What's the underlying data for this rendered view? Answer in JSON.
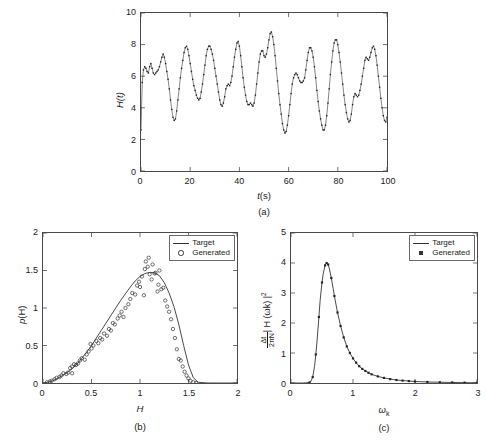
{
  "figure": {
    "panels": [
      "a",
      "b",
      "c"
    ],
    "background_color": "#ffffff",
    "line_color": "#333333",
    "axis_color": "#4a4a4a"
  },
  "panel_a": {
    "caption": "(a)",
    "xlabel_var": "t",
    "xlabel_unit": "(s)",
    "ylabel_var": "H",
    "ylabel_arg": "(t)",
    "xticks": [
      "0",
      "20",
      "40",
      "60",
      "80",
      "100"
    ],
    "yticks": [
      "0",
      "2",
      "4",
      "6",
      "8",
      "10"
    ]
  },
  "panel_b": {
    "caption": "(b)",
    "xlabel": "H",
    "ylabel_var": "p",
    "ylabel_arg": "(H)",
    "xticks": [
      "0",
      "0.5",
      "1",
      "1.5",
      "2"
    ],
    "yticks": [
      "0",
      "0.5",
      "1",
      "1.5",
      "2"
    ],
    "legend": [
      {
        "label": "Target",
        "marker": "line"
      },
      {
        "label": "Generated",
        "marker": "circle"
      }
    ]
  },
  "panel_c": {
    "caption": "(c)",
    "xlabel_var": "ω",
    "xlabel_sub": "k",
    "ylabel_num": "Δt",
    "ylabel_den": "2πN",
    "ylabel_rest": "| H (ωk) |",
    "ylabel_exp": "2",
    "xticks": [
      "0",
      "1",
      "2",
      "3"
    ],
    "yticks": [
      "0",
      "1",
      "2",
      "3",
      "4",
      "5"
    ],
    "legend": [
      {
        "label": "Target",
        "marker": "line"
      },
      {
        "label": "Generated",
        "marker": "square"
      }
    ]
  },
  "chart_data": [
    {
      "type": "line",
      "panel": "a",
      "title": "",
      "xlabel": "t(s)",
      "ylabel": "H(t)",
      "xlim": [
        0,
        100
      ],
      "ylim": [
        0,
        10
      ],
      "xticks": [
        0,
        20,
        40,
        60,
        80,
        100
      ],
      "yticks": [
        0,
        2,
        4,
        6,
        8,
        10
      ],
      "grid": false,
      "legend": null,
      "marker": "dot",
      "series": [
        {
          "name": "H(t)",
          "x": [
            0,
            0.5,
            1,
            1.5,
            2,
            2.5,
            3,
            3.5,
            4,
            4.5,
            5,
            5.5,
            6,
            6.5,
            7,
            7.5,
            8,
            8.5,
            9,
            9.5,
            10,
            10.5,
            11,
            11.5,
            12,
            12.5,
            13,
            13.5,
            14,
            14.5,
            15,
            15.5,
            16,
            16.5,
            17,
            17.5,
            18,
            18.5,
            19,
            19.5,
            20,
            20.5,
            21,
            21.5,
            22,
            22.5,
            23,
            23.5,
            24,
            24.5,
            25,
            25.5,
            26,
            26.5,
            27,
            27.5,
            28,
            28.5,
            29,
            29.5,
            30,
            30.5,
            31,
            31.5,
            32,
            32.5,
            33,
            33.5,
            34,
            34.5,
            35,
            35.5,
            36,
            36.5,
            37,
            37.5,
            38,
            38.5,
            39,
            39.5,
            40,
            40.5,
            41,
            41.5,
            42,
            42.5,
            43,
            43.5,
            44,
            44.5,
            45,
            45.5,
            46,
            46.5,
            47,
            47.5,
            48,
            48.5,
            49,
            49.5,
            50,
            50.5,
            51,
            51.5,
            52,
            52.5,
            53,
            53.5,
            54,
            54.5,
            55,
            55.5,
            56,
            56.5,
            57,
            57.5,
            58,
            58.5,
            59,
            59.5,
            60,
            60.5,
            61,
            61.5,
            62,
            62.5,
            63,
            63.5,
            64,
            64.5,
            65,
            65.5,
            66,
            66.5,
            67,
            67.5,
            68,
            68.5,
            69,
            69.5,
            70,
            70.5,
            71,
            71.5,
            72,
            72.5,
            73,
            73.5,
            74,
            74.5,
            75,
            75.5,
            76,
            76.5,
            77,
            77.5,
            78,
            78.5,
            79,
            79.5,
            80,
            80.5,
            81,
            81.5,
            82,
            82.5,
            83,
            83.5,
            84,
            84.5,
            85,
            85.5,
            86,
            86.5,
            87,
            87.5,
            88,
            88.5,
            89,
            89.5,
            90,
            90.5,
            91,
            91.5,
            92,
            92.5,
            93,
            93.5,
            94,
            94.5,
            95,
            95.5,
            96,
            96.5,
            97,
            97.5,
            98,
            98.5,
            99,
            99.5,
            100
          ],
          "y": [
            2.6,
            5.6,
            6.4,
            6.6,
            6.5,
            6.3,
            6.2,
            6.6,
            6.8,
            6.5,
            6.2,
            6.1,
            6.2,
            6.3,
            6.4,
            6.6,
            6.9,
            7.2,
            7.4,
            7.2,
            6.8,
            6.3,
            5.8,
            5.2,
            4.5,
            3.9,
            3.4,
            3.2,
            3.3,
            3.8,
            4.5,
            5.2,
            5.9,
            6.5,
            7.0,
            7.5,
            7.8,
            7.9,
            7.7,
            7.3,
            6.8,
            6.3,
            5.8,
            5.4,
            5.1,
            4.8,
            4.6,
            4.5,
            4.6,
            5.0,
            5.5,
            6.1,
            6.7,
            7.3,
            7.7,
            7.9,
            7.9,
            7.7,
            7.4,
            7.0,
            6.5,
            6.0,
            5.5,
            5.0,
            4.5,
            4.2,
            4.1,
            4.3,
            4.7,
            5.2,
            5.4,
            5.5,
            5.4,
            5.6,
            6.0,
            6.6,
            7.2,
            7.7,
            8.1,
            8.2,
            7.9,
            7.3,
            6.6,
            5.9,
            5.3,
            4.8,
            4.4,
            4.2,
            4.2,
            4.3,
            4.2,
            4.1,
            4.3,
            4.8,
            5.5,
            6.2,
            6.9,
            7.4,
            7.6,
            7.6,
            7.3,
            7.2,
            7.4,
            7.8,
            8.3,
            8.7,
            8.8,
            8.5,
            8.0,
            7.3,
            6.5,
            5.7,
            4.9,
            4.2,
            3.6,
            3.0,
            2.6,
            2.4,
            2.5,
            2.9,
            3.5,
            4.2,
            4.9,
            5.5,
            5.9,
            6.1,
            6.2,
            6.1,
            5.9,
            5.7,
            5.6,
            5.6,
            5.7,
            5.9,
            6.4,
            7.0,
            7.5,
            7.8,
            7.8,
            7.6,
            7.2,
            6.6,
            5.9,
            5.1,
            4.4,
            3.8,
            3.3,
            2.9,
            2.6,
            2.6,
            2.9,
            3.5,
            4.3,
            5.2,
            6.1,
            6.9,
            7.6,
            8.1,
            8.3,
            8.3,
            8.0,
            7.5,
            6.9,
            6.2,
            5.5,
            4.8,
            4.2,
            3.7,
            3.3,
            3.1,
            3.2,
            3.6,
            4.2,
            4.7,
            4.9,
            4.8,
            4.7,
            4.8,
            5.1,
            5.5,
            6.0,
            6.5,
            7.0,
            7.2,
            7.1,
            7.0,
            7.2,
            7.5,
            7.8,
            7.9,
            7.7,
            7.3,
            6.7,
            6.0,
            5.3,
            4.6,
            4.0,
            3.5,
            3.2,
            3.1,
            3.4,
            4.0,
            4.8,
            5.6,
            6.3,
            6.6,
            6.4,
            6.0,
            5.7,
            5.8,
            6.1
          ]
        }
      ]
    },
    {
      "type": "line",
      "panel": "b",
      "title": "",
      "xlabel": "H",
      "ylabel": "p(H)",
      "xlim": [
        0,
        2
      ],
      "ylim": [
        0,
        2
      ],
      "xticks": [
        0,
        0.5,
        1,
        1.5,
        2
      ],
      "yticks": [
        0,
        0.5,
        1,
        1.5,
        2
      ],
      "grid": false,
      "legend": [
        "Target",
        "Generated"
      ],
      "legend_position": "top-right",
      "series": [
        {
          "name": "Target",
          "style": "line",
          "x": [
            0,
            0.05,
            0.1,
            0.15,
            0.2,
            0.25,
            0.3,
            0.35,
            0.4,
            0.45,
            0.5,
            0.55,
            0.6,
            0.65,
            0.7,
            0.75,
            0.8,
            0.85,
            0.9,
            0.95,
            1,
            1.05,
            1.1,
            1.15,
            1.2,
            1.25,
            1.3,
            1.35,
            1.4,
            1.45,
            1.5,
            1.55,
            1.6,
            1.7,
            1.8,
            1.9,
            2
          ],
          "y": [
            0,
            0.01,
            0.03,
            0.06,
            0.1,
            0.14,
            0.19,
            0.25,
            0.33,
            0.41,
            0.5,
            0.6,
            0.7,
            0.8,
            0.9,
            1.0,
            1.1,
            1.19,
            1.28,
            1.36,
            1.42,
            1.46,
            1.475,
            1.47,
            1.43,
            1.34,
            1.2,
            1.02,
            0.78,
            0.5,
            0.24,
            0.07,
            0.01,
            0,
            0,
            0,
            0
          ]
        },
        {
          "name": "Generated",
          "style": "circles",
          "x": [
            0.04,
            0.07,
            0.09,
            0.12,
            0.14,
            0.17,
            0.19,
            0.21,
            0.24,
            0.26,
            0.28,
            0.3,
            0.3,
            0.32,
            0.34,
            0.36,
            0.38,
            0.4,
            0.43,
            0.45,
            0.47,
            0.49,
            0.5,
            0.52,
            0.55,
            0.57,
            0.59,
            0.61,
            0.63,
            0.66,
            0.68,
            0.7,
            0.72,
            0.74,
            0.77,
            0.79,
            0.81,
            0.83,
            0.85,
            0.88,
            0.9,
            0.92,
            0.95,
            0.97,
            0.99,
            1.0,
            1.02,
            1.04,
            1.05,
            1.06,
            1.08,
            1.09,
            1.1,
            1.12,
            1.13,
            1.15,
            1.16,
            1.18,
            1.19,
            1.2,
            1.22,
            1.24,
            1.26,
            1.28,
            1.3,
            1.32,
            1.34,
            1.36,
            1.38,
            1.4,
            1.42,
            1.44,
            1.46,
            1.48,
            1.5,
            1.52,
            1.55,
            1.58
          ],
          "y": [
            0.01,
            0.02,
            0.03,
            0.05,
            0.07,
            0.08,
            0.1,
            0.13,
            0.12,
            0.14,
            0.2,
            0.13,
            0.22,
            0.25,
            0.24,
            0.26,
            0.3,
            0.33,
            0.31,
            0.38,
            0.42,
            0.52,
            0.46,
            0.5,
            0.56,
            0.53,
            0.6,
            0.58,
            0.66,
            0.63,
            0.72,
            0.7,
            0.8,
            0.78,
            0.86,
            0.9,
            0.95,
            0.88,
            1.0,
            1.05,
            1.12,
            1.2,
            1.18,
            1.3,
            1.35,
            1.28,
            1.42,
            1.17,
            1.52,
            1.62,
            1.55,
            1.67,
            1.45,
            1.38,
            1.58,
            1.46,
            1.47,
            1.22,
            1.31,
            1.5,
            1.25,
            1.27,
            1.1,
            1.02,
            0.95,
            0.85,
            0.72,
            0.6,
            0.45,
            0.32,
            0.3,
            0.22,
            0.15,
            0.1,
            0.06,
            0.03,
            0.01,
            0.0
          ]
        }
      ]
    },
    {
      "type": "line",
      "panel": "c",
      "title": "",
      "xlabel": "ωk",
      "ylabel": "Δt/(2πN) | H (ωk) |^2",
      "xlim": [
        0,
        3
      ],
      "ylim": [
        0,
        5
      ],
      "xticks": [
        0,
        1,
        2,
        3
      ],
      "yticks": [
        0,
        1,
        2,
        3,
        4,
        5
      ],
      "grid": false,
      "legend": [
        "Target",
        "Generated"
      ],
      "legend_position": "top-right",
      "peak_value": 4.0,
      "peak_x": 0.57,
      "series": [
        {
          "name": "Target",
          "style": "line",
          "x": [
            0,
            0.05,
            0.1,
            0.15,
            0.2,
            0.25,
            0.3,
            0.32,
            0.35,
            0.38,
            0.4,
            0.42,
            0.45,
            0.47,
            0.5,
            0.52,
            0.55,
            0.57,
            0.6,
            0.62,
            0.65,
            0.68,
            0.7,
            0.75,
            0.8,
            0.85,
            0.9,
            0.95,
            1.0,
            1.05,
            1.1,
            1.15,
            1.2,
            1.3,
            1.4,
            1.5,
            1.6,
            1.7,
            1.8,
            1.9,
            2.0,
            2.2,
            2.4,
            2.6,
            2.8,
            3.0
          ],
          "y": [
            0,
            0,
            0,
            0,
            0,
            0.01,
            0.02,
            0.05,
            0.2,
            0.55,
            0.95,
            1.4,
            2.2,
            2.75,
            3.35,
            3.65,
            3.92,
            4.0,
            3.95,
            3.8,
            3.5,
            3.15,
            2.9,
            2.35,
            1.9,
            1.52,
            1.22,
            1.0,
            0.82,
            0.68,
            0.56,
            0.47,
            0.4,
            0.29,
            0.22,
            0.17,
            0.13,
            0.1,
            0.08,
            0.065,
            0.05,
            0.035,
            0.025,
            0.018,
            0.012,
            0.008
          ]
        },
        {
          "name": "Generated",
          "style": "markers",
          "x": [
            0.3,
            0.35,
            0.4,
            0.45,
            0.5,
            0.55,
            0.575,
            0.6,
            0.65,
            0.7,
            0.75,
            0.8,
            0.85,
            0.9,
            0.95,
            1.0,
            1.05,
            1.1,
            1.15,
            1.2,
            1.25,
            1.3,
            1.4,
            1.5,
            1.6,
            1.7,
            1.8,
            1.9,
            2.0,
            2.2,
            2.4,
            2.6,
            2.8,
            3.0
          ],
          "y": [
            0.02,
            0.2,
            0.95,
            2.2,
            3.35,
            3.92,
            4.0,
            3.95,
            3.5,
            2.9,
            2.35,
            1.9,
            1.52,
            1.22,
            1.0,
            0.82,
            0.68,
            0.56,
            0.47,
            0.4,
            0.34,
            0.29,
            0.22,
            0.17,
            0.13,
            0.1,
            0.08,
            0.065,
            0.05,
            0.035,
            0.025,
            0.018,
            0.012,
            0.008
          ]
        }
      ]
    }
  ]
}
